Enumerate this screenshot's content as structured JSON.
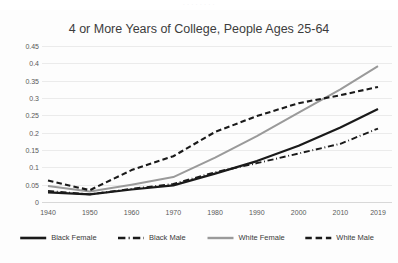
{
  "top_fragment": "· · · · · · · ·",
  "chart_data": {
    "type": "line",
    "title": "4 or More Years of College, People Ages 25-64",
    "xlabel": "",
    "ylabel": "",
    "grid": true,
    "legend_position": "bottom",
    "x": [
      1940,
      1950,
      1960,
      1970,
      1980,
      1990,
      2000,
      2010,
      2019
    ],
    "xtick_labels": [
      "1940",
      "1950",
      "1960",
      "1970",
      "1980",
      "1990",
      "2000",
      "2010",
      "2019"
    ],
    "ylim": [
      0,
      0.45
    ],
    "ytick_labels": [
      "0",
      "0.05",
      "0.1",
      "0.15",
      "0.2",
      "0.25",
      "0.3",
      "0.35",
      "0.4",
      "0.45"
    ],
    "ytick_values": [
      0,
      0.05,
      0.1,
      0.15,
      0.2,
      0.25,
      0.3,
      0.35,
      0.4,
      0.45
    ],
    "series": [
      {
        "name": "Black Female",
        "color": "#1a1a1a",
        "width": 2.2,
        "dash": "none",
        "values": [
          0.028,
          0.022,
          0.036,
          0.048,
          0.082,
          0.118,
          0.162,
          0.215,
          0.268
        ]
      },
      {
        "name": "Black Male",
        "color": "#1a1a1a",
        "width": 1.9,
        "dash": "dashdot",
        "values": [
          0.032,
          0.022,
          0.038,
          0.052,
          0.086,
          0.112,
          0.14,
          0.168,
          0.212
        ]
      },
      {
        "name": "White Female",
        "color": "#9a9a9a",
        "width": 2.0,
        "dash": "none",
        "values": [
          0.046,
          0.03,
          0.05,
          0.072,
          0.128,
          0.19,
          0.258,
          0.325,
          0.392
        ]
      },
      {
        "name": "White Male",
        "color": "#1a1a1a",
        "width": 2.1,
        "dash": "dashed",
        "values": [
          0.062,
          0.034,
          0.092,
          0.132,
          0.202,
          0.248,
          0.285,
          0.308,
          0.332
        ]
      }
    ]
  }
}
